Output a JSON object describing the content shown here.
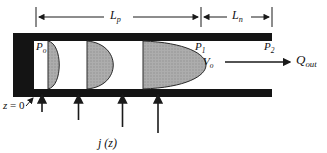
{
  "figure": {
    "type": "diagram",
    "labels": {
      "Lp": {
        "base": "L",
        "sub": "p"
      },
      "Ln": {
        "base": "L",
        "sub": "n"
      },
      "P0": {
        "base": "P",
        "sub": "o"
      },
      "P1": {
        "base": "P",
        "sub": "1"
      },
      "P2": {
        "base": "P",
        "sub": "2"
      },
      "V0": {
        "base": "V",
        "sub": "o"
      },
      "Qout": {
        "base": "Q",
        "sub": "out"
      },
      "z0": {
        "var": "z",
        "eq": " = 0"
      },
      "jz": {
        "base": "j",
        "arg": " (z)"
      }
    },
    "colors": {
      "wall": "#141414",
      "profile_fill": "#a8a8a8",
      "profile_stroke": "#2a2a2a",
      "line": "#1a1a1a",
      "background": "#ffffff"
    }
  }
}
